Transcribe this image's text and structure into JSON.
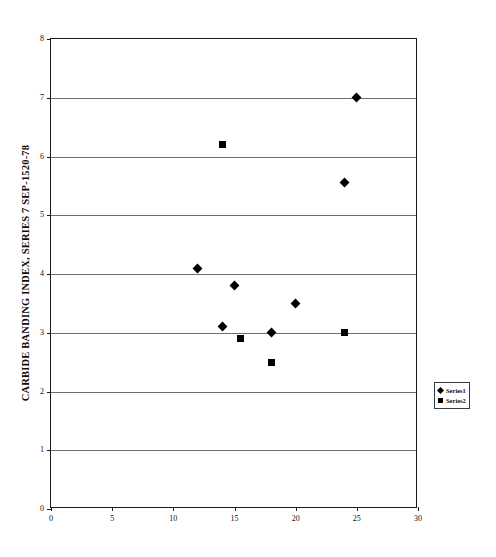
{
  "chart_data": {
    "type": "scatter",
    "title": "",
    "xlabel": "",
    "ylabel": "CARBIDE BANDING INDEX, SERIES 7 SEP-1520-78",
    "xlim": [
      0,
      30
    ],
    "ylim": [
      0,
      8
    ],
    "xticks": [
      0,
      5,
      10,
      15,
      20,
      25,
      30
    ],
    "yticks": [
      0,
      1,
      2,
      3,
      4,
      5,
      6,
      7,
      8
    ],
    "grid": "horizontal",
    "legend_position": "right",
    "series": [
      {
        "name": "Series1",
        "marker": "diamond",
        "color": "#000000",
        "points": [
          {
            "x": 12.0,
            "y": 4.1
          },
          {
            "x": 14.0,
            "y": 3.1
          },
          {
            "x": 15.0,
            "y": 3.8
          },
          {
            "x": 18.0,
            "y": 3.0
          },
          {
            "x": 20.0,
            "y": 3.5
          },
          {
            "x": 24.0,
            "y": 5.55
          },
          {
            "x": 25.0,
            "y": 7.0
          }
        ]
      },
      {
        "name": "Series2",
        "marker": "square",
        "color": "#000000",
        "points": [
          {
            "x": 14.0,
            "y": 6.2
          },
          {
            "x": 15.5,
            "y": 2.9
          },
          {
            "x": 18.0,
            "y": 2.5
          },
          {
            "x": 24.0,
            "y": 3.0
          }
        ]
      }
    ]
  },
  "legend": {
    "entries": [
      {
        "label": "Series1",
        "marker": "diamond"
      },
      {
        "label": "Series2",
        "marker": "square"
      }
    ]
  }
}
